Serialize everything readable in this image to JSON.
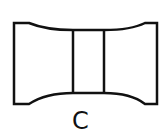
{
  "diagram": {
    "label": "C",
    "stroke_color": "#111111",
    "background": "#ffffff",
    "shape": "concave-waisted block with two vertical dividers"
  }
}
